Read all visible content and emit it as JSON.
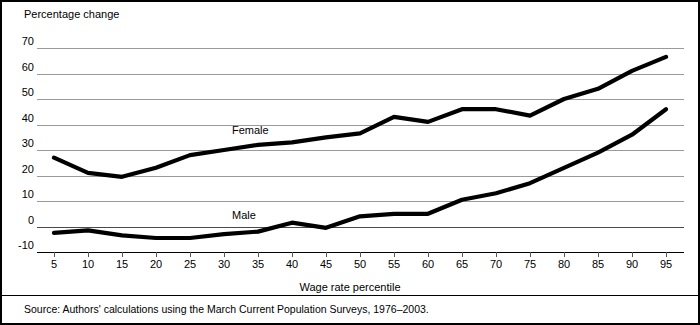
{
  "axis": {
    "y_title": "Percentage change",
    "x_title": "Wage rate percentile",
    "y_ticks": [
      70,
      60,
      50,
      40,
      30,
      20,
      10,
      0,
      -10
    ],
    "y_tick_labels": [
      "70",
      "60",
      "50",
      "40",
      "30",
      "20",
      "10",
      "0",
      "-10"
    ],
    "x_ticks": [
      5,
      10,
      15,
      20,
      25,
      30,
      35,
      40,
      45,
      50,
      55,
      60,
      65,
      70,
      75,
      80,
      85,
      90,
      95
    ],
    "x_tick_labels": [
      "5",
      "10",
      "15",
      "20",
      "25",
      "30",
      "35",
      "40",
      "45",
      "50",
      "55",
      "60",
      "65",
      "70",
      "75",
      "80",
      "85",
      "90",
      "95"
    ]
  },
  "labels": {
    "female": "Female",
    "male": "Male"
  },
  "source": {
    "text": "Source: Authors' calculations using the March Current Population Surveys, 1976–2003."
  },
  "colors": {
    "line": "#000000",
    "grid": "#9a9a9a",
    "frame": "#000000",
    "background": "#ffffff"
  },
  "chart_data": {
    "type": "line",
    "title": "",
    "subtitle": "",
    "xlabel": "Wage rate percentile",
    "ylabel": "Percentage change",
    "xlim": [
      5,
      95
    ],
    "ylim": [
      -10,
      70
    ],
    "grid": true,
    "legend_position": "inline-annotation",
    "x": [
      5,
      10,
      15,
      20,
      25,
      30,
      35,
      40,
      45,
      50,
      55,
      60,
      65,
      70,
      75,
      80,
      85,
      90,
      95
    ],
    "series": [
      {
        "name": "Female",
        "values": [
          27,
          21,
          19.5,
          23,
          28,
          30,
          32,
          33,
          35,
          36.5,
          43,
          41,
          46,
          46,
          43.5,
          50,
          54,
          61,
          66.5
        ]
      },
      {
        "name": "Male",
        "values": [
          -2.5,
          -1.5,
          -3.5,
          -4.5,
          -4.5,
          -3,
          -2,
          1.5,
          -0.5,
          4,
          5,
          5,
          10.5,
          13,
          17,
          23,
          29,
          36,
          46
        ]
      }
    ]
  }
}
